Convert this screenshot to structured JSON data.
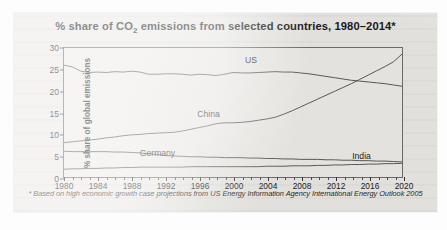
{
  "card": {
    "title_prefix": "% share of CO",
    "title_sub": "2",
    "title_suffix": " emissions from selected countries, 1980–2014*",
    "footnote": "* Based on high economic growth case projections from US Energy Information Agency International Energy Outlook 2005"
  },
  "chart_data": {
    "type": "line",
    "title": "% share of CO2 emissions from selected countries, 1980–2014*",
    "xlabel": "",
    "ylabel": "% share of global emissions",
    "xlim": [
      1980,
      2020
    ],
    "ylim": [
      0,
      30
    ],
    "yticks": [
      0,
      5,
      10,
      15,
      20,
      25,
      30
    ],
    "xticks": [
      1980,
      1984,
      1988,
      1992,
      1996,
      2000,
      2004,
      2008,
      2012,
      2016,
      2020
    ],
    "minor_x_step": 1,
    "grid": false,
    "legend": "inline-labels",
    "line_color": "#5a5a5a",
    "x": [
      1980,
      1981,
      1982,
      1983,
      1984,
      1985,
      1986,
      1987,
      1988,
      1989,
      1990,
      1991,
      1992,
      1993,
      1994,
      1995,
      1996,
      1997,
      1998,
      1999,
      2000,
      2001,
      2002,
      2003,
      2004,
      2005,
      2006,
      2007,
      2008,
      2009,
      2010,
      2011,
      2012,
      2013,
      2014,
      2015,
      2016,
      2017,
      2018,
      2019,
      2020
    ],
    "series": [
      {
        "name": "US",
        "label_x": 2002,
        "label_y": 27.2,
        "values": [
          26.0,
          25.6,
          24.6,
          24.3,
          24.4,
          24.3,
          24.5,
          24.4,
          24.6,
          24.4,
          23.9,
          23.9,
          24.0,
          24.0,
          23.9,
          23.7,
          23.9,
          23.8,
          23.6,
          23.9,
          24.3,
          24.2,
          24.2,
          24.3,
          24.4,
          24.5,
          24.4,
          24.4,
          24.2,
          24.0,
          23.7,
          23.4,
          23.1,
          22.8,
          22.5,
          22.3,
          22.1,
          21.9,
          21.7,
          21.4,
          21.1
        ]
      },
      {
        "name": "China",
        "label_x": 1997,
        "label_y": 15.0,
        "values": [
          8.0,
          8.2,
          8.4,
          8.6,
          8.8,
          9.1,
          9.3,
          9.6,
          9.8,
          9.9,
          10.1,
          10.2,
          10.3,
          10.4,
          10.7,
          11.1,
          11.5,
          11.9,
          12.4,
          12.6,
          12.6,
          12.7,
          12.9,
          13.2,
          13.5,
          13.9,
          14.6,
          15.4,
          16.3,
          17.2,
          18.1,
          19.0,
          19.9,
          20.8,
          21.7,
          22.7,
          23.7,
          24.7,
          25.7,
          26.8,
          28.6
        ]
      },
      {
        "name": "Germany",
        "label_x": 1991,
        "label_y": 5.9,
        "values": [
          6.0,
          5.9,
          5.9,
          5.9,
          5.9,
          5.9,
          5.8,
          5.8,
          5.7,
          5.6,
          5.4,
          5.2,
          5.0,
          4.9,
          4.8,
          4.7,
          4.7,
          4.6,
          4.6,
          4.5,
          4.5,
          4.5,
          4.4,
          4.4,
          4.3,
          4.3,
          4.2,
          4.2,
          4.1,
          4.1,
          4.1,
          4.0,
          4.0,
          3.9,
          3.9,
          3.8,
          3.8,
          3.7,
          3.7,
          3.6,
          3.5
        ]
      },
      {
        "name": "India",
        "label_x": 2015,
        "label_y": 5.3,
        "values": [
          1.8,
          1.9,
          1.9,
          2.0,
          2.0,
          2.1,
          2.1,
          2.2,
          2.2,
          2.3,
          2.3,
          2.3,
          2.3,
          2.3,
          2.3,
          2.4,
          2.4,
          2.4,
          2.4,
          2.4,
          2.4,
          2.4,
          2.4,
          2.4,
          2.5,
          2.5,
          2.5,
          2.6,
          2.6,
          2.6,
          2.7,
          2.7,
          2.8,
          2.8,
          2.9,
          2.9,
          3.0,
          3.0,
          3.1,
          3.1,
          3.2
        ]
      }
    ]
  }
}
